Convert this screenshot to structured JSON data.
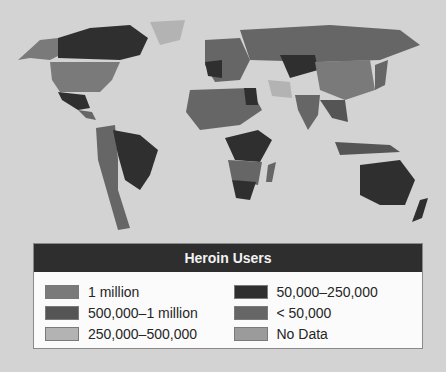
{
  "legend": {
    "title": "Heroin Users",
    "items": [
      {
        "label": "1 million",
        "color": "#7a7a7a"
      },
      {
        "label": "500,000–1 million",
        "color": "#555555"
      },
      {
        "label": "250,000–500,000",
        "color": "#b3b3b3"
      },
      {
        "label": "50,000–250,000",
        "color": "#2f2f2f"
      },
      {
        "label": "< 50,000",
        "color": "#666666"
      },
      {
        "label": "No Data",
        "color": "#9b9b9b"
      }
    ]
  },
  "map": {
    "background": "#d3d3d3",
    "regions": [
      {
        "name": "alaska",
        "category": "1 million"
      },
      {
        "name": "canada",
        "category": "50,000–250,000"
      },
      {
        "name": "usa",
        "category": "1 million"
      },
      {
        "name": "mexico",
        "category": "50,000–250,000"
      },
      {
        "name": "greenland",
        "category": "250,000–500,000"
      },
      {
        "name": "brazil",
        "category": "50,000–250,000"
      },
      {
        "name": "south-america-west",
        "category": "< 50,000"
      },
      {
        "name": "europe",
        "category": "< 50,000"
      },
      {
        "name": "russia",
        "category": "< 50,000"
      },
      {
        "name": "china",
        "category": "< 50,000"
      },
      {
        "name": "central-asia",
        "category": "50,000–250,000"
      },
      {
        "name": "africa-north",
        "category": "< 50,000"
      },
      {
        "name": "africa-central",
        "category": "50,000–250,000"
      },
      {
        "name": "south-africa",
        "category": "50,000–250,000"
      },
      {
        "name": "india",
        "category": "< 50,000"
      },
      {
        "name": "australia",
        "category": "50,000–250,000"
      }
    ]
  }
}
